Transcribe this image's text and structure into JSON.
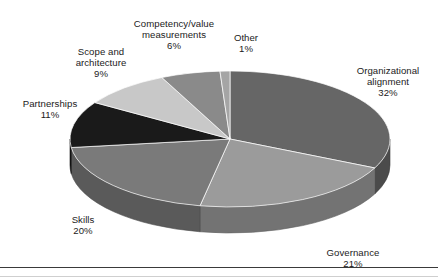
{
  "chart_data": {
    "type": "pie",
    "title": "",
    "subtitle": "",
    "xlabel": "",
    "ylabel": "",
    "legend_position": "none",
    "grid": false,
    "value_unit": "%",
    "start_angle_deg": 0,
    "direction": "clockwise",
    "three_d": true,
    "categories": [
      "Organizational alignment",
      "Governance",
      "Skills",
      "Partnerships",
      "Scope and architecture",
      "Competency/value measurements",
      "Other"
    ],
    "values": [
      32,
      21,
      20,
      11,
      9,
      6,
      1
    ],
    "colors": [
      "#666666",
      "#9b9b9b",
      "#7a7a7a",
      "#1a1a1a",
      "#c8c8c8",
      "#8a8a8a",
      "#a5a5a5"
    ],
    "slices": [
      {
        "label": "Organizational alignment",
        "label_line1": "Organizational",
        "label_line2": "alignment",
        "value": 32,
        "percent_text": "32%",
        "color": "#666666"
      },
      {
        "label": "Governance",
        "label_line1": "Governance",
        "label_line2": "",
        "value": 21,
        "percent_text": "21%",
        "color": "#9b9b9b"
      },
      {
        "label": "Skills",
        "label_line1": "Skills",
        "label_line2": "",
        "value": 20,
        "percent_text": "20%",
        "color": "#7a7a7a"
      },
      {
        "label": "Partnerships",
        "label_line1": "Partnerships",
        "label_line2": "",
        "value": 11,
        "percent_text": "11%",
        "color": "#1a1a1a"
      },
      {
        "label": "Scope and architecture",
        "label_line1": "Scope and",
        "label_line2": "architecture",
        "value": 9,
        "percent_text": "9%",
        "color": "#c8c8c8"
      },
      {
        "label": "Competency/value measurements",
        "label_line1": "Competency/value",
        "label_line2": "measurements",
        "value": 6,
        "percent_text": "6%",
        "color": "#8a8a8a"
      },
      {
        "label": "Other",
        "label_line1": "Other",
        "label_line2": "",
        "value": 1,
        "percent_text": "1%",
        "color": "#a5a5a5"
      }
    ]
  },
  "labels": {
    "organizational_alignment": {
      "line1": "Organizational",
      "line2": "alignment",
      "percent": "32%"
    },
    "governance": {
      "line1": "Governance",
      "percent": "21%"
    },
    "skills": {
      "line1": "Skills",
      "percent": "20%"
    },
    "partnerships": {
      "line1": "Partnerships",
      "percent": "11%"
    },
    "scope_and_architecture": {
      "line1": "Scope and",
      "line2": "architecture",
      "percent": "9%"
    },
    "competency_value_measurements": {
      "line1": "Competency/value",
      "line2": "measurements",
      "percent": "6%"
    },
    "other": {
      "line1": "Other",
      "percent": "1%"
    }
  }
}
